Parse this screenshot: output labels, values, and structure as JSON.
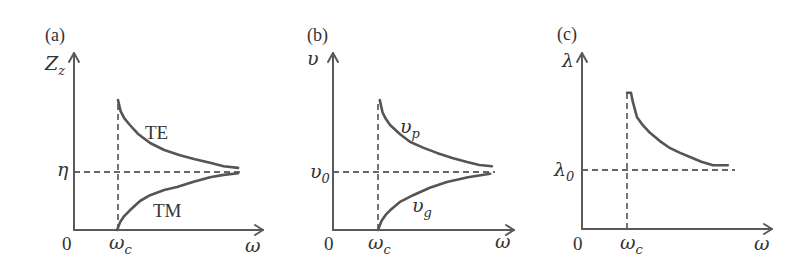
{
  "figure": {
    "panels": [
      {
        "tag": "(a)",
        "y_label": "Z",
        "y_label_sub": "z",
        "ref_label": "η",
        "origin_label": "0",
        "cutoff_label": "ω",
        "cutoff_label_sub": "c",
        "x_label": "ω",
        "curve_labels": [
          {
            "text": "TE",
            "sub": ""
          },
          {
            "text": "TM",
            "sub": ""
          }
        ]
      },
      {
        "tag": "(b)",
        "y_label": "υ",
        "y_label_sub": "",
        "ref_label": "υ",
        "ref_label_sub": "0",
        "origin_label": "0",
        "cutoff_label": "ω",
        "cutoff_label_sub": "c",
        "x_label": "ω",
        "curve_labels": [
          {
            "text": "υ",
            "sub": "p"
          },
          {
            "text": "υ",
            "sub": "g"
          }
        ]
      },
      {
        "tag": "(c)",
        "y_label": "λ",
        "y_label_sub": "",
        "ref_label": "λ",
        "ref_label_sub": "0",
        "origin_label": "0",
        "cutoff_label": "ω",
        "cutoff_label_sub": "c",
        "x_label": "ω",
        "curve_labels": []
      }
    ]
  },
  "chart_data": [
    {
      "type": "line",
      "title": "(a)",
      "xlabel": "ω",
      "ylabel": "Z_z",
      "x_units": "ω / ω_c",
      "y_units": "Z_z / η",
      "x_ticks": [
        "0",
        "ω_c"
      ],
      "y_ticks": [
        "η"
      ],
      "grid": false,
      "legend": "inline labels",
      "series": [
        {
          "name": "TE",
          "x": [
            1.0,
            1.06,
            1.14,
            1.27,
            1.45,
            1.73,
            2.05,
            2.41,
            2.75,
            3.09,
            3.4,
            3.73
          ],
          "y": [
            2.24,
            2.05,
            1.93,
            1.81,
            1.66,
            1.5,
            1.38,
            1.29,
            1.22,
            1.16,
            1.1,
            1.07
          ]
        },
        {
          "name": "TM",
          "x": [
            0.98,
            1.05,
            1.14,
            1.27,
            1.5,
            1.73,
            2.05,
            2.34,
            2.7,
            3.09,
            3.4,
            3.73
          ],
          "y": [
            0.0,
            0.14,
            0.24,
            0.34,
            0.5,
            0.6,
            0.69,
            0.74,
            0.83,
            0.91,
            0.95,
            0.98
          ]
        }
      ],
      "reference_lines": [
        {
          "axis": "x",
          "label": "ω_c",
          "value": 1.0,
          "from": 0,
          "to": 2.24,
          "style": "dashed"
        },
        {
          "axis": "y",
          "label": "η",
          "value": 1.0,
          "from": 0,
          "to": 3.77,
          "style": "dashed"
        }
      ]
    },
    {
      "type": "line",
      "title": "(b)",
      "xlabel": "ω",
      "ylabel": "υ",
      "x_units": "ω / ω_c",
      "y_units": "υ / υ_0",
      "x_ticks": [
        "0",
        "ω_c"
      ],
      "y_ticks": [
        "υ_0"
      ],
      "grid": false,
      "legend": "inline labels",
      "series": [
        {
          "name": "υ_p",
          "x": [
            1.04,
            1.1,
            1.17,
            1.27,
            1.49,
            1.71,
            2.0,
            2.31,
            2.65,
            2.98,
            3.25,
            3.53
          ],
          "y": [
            2.24,
            2.03,
            1.92,
            1.81,
            1.65,
            1.52,
            1.42,
            1.33,
            1.24,
            1.17,
            1.12,
            1.1
          ]
        },
        {
          "name": "υ_g",
          "x": [
            1.0,
            1.08,
            1.17,
            1.27,
            1.5,
            1.78,
            2.15,
            2.53,
            3.0,
            3.49
          ],
          "y": [
            0.0,
            0.16,
            0.26,
            0.34,
            0.49,
            0.6,
            0.73,
            0.83,
            0.91,
            0.97
          ]
        }
      ],
      "reference_lines": [
        {
          "axis": "x",
          "label": "ω_c",
          "value": 1.0,
          "from": 0,
          "to": 2.24,
          "style": "dashed"
        },
        {
          "axis": "y",
          "label": "υ_0",
          "value": 1.0,
          "from": 0,
          "to": 3.6,
          "style": "dashed"
        }
      ]
    },
    {
      "type": "line",
      "title": "(c)",
      "xlabel": "ω",
      "ylabel": "λ",
      "x_units": "ω / ω_c",
      "y_units": "λ / λ_0",
      "x_ticks": [
        "0",
        "ω_c"
      ],
      "y_ticks": [
        "λ_0"
      ],
      "grid": false,
      "legend": "none",
      "series": [
        {
          "name": "λ",
          "x": [
            1.0,
            1.09,
            1.13,
            1.22,
            1.35,
            1.51,
            1.73,
            1.96,
            2.18,
            2.4,
            2.65,
            2.91,
            3.24
          ],
          "y": [
            2.31,
            2.31,
            2.15,
            1.9,
            1.76,
            1.63,
            1.49,
            1.37,
            1.29,
            1.22,
            1.14,
            1.08,
            1.08
          ]
        }
      ],
      "reference_lines": [
        {
          "axis": "x",
          "label": "ω_c",
          "value": 1.0,
          "from": 0,
          "to": 2.31,
          "style": "dashed"
        },
        {
          "axis": "y",
          "label": "λ_0",
          "value": 1.0,
          "from": 0,
          "to": 3.4,
          "style": "dashed"
        }
      ]
    }
  ]
}
